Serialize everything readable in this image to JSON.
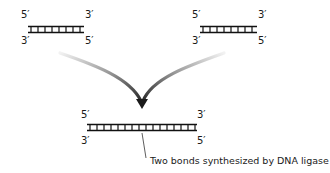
{
  "diagram": {
    "fragments": [
      {
        "id": "left-fragment",
        "top_left_label": "5′",
        "top_right_label": "3′",
        "bottom_left_label": "3′",
        "bottom_right_label": "5′",
        "rungs": 8
      },
      {
        "id": "right-fragment",
        "top_left_label": "5′",
        "top_right_label": "3′",
        "bottom_left_label": "3′",
        "bottom_right_label": "5′",
        "rungs": 8
      },
      {
        "id": "joined-fragment",
        "top_left_label": "5′",
        "top_right_label": "3′",
        "bottom_left_label": "3′",
        "bottom_right_label": "5′",
        "rungs": 16
      }
    ],
    "annotation": "Two bonds synthesized by DNA ligase",
    "colors": {
      "strand": "#111111",
      "arrow_dark": "#2a2a2a",
      "arrow_fade": "#e0e0e0"
    }
  }
}
